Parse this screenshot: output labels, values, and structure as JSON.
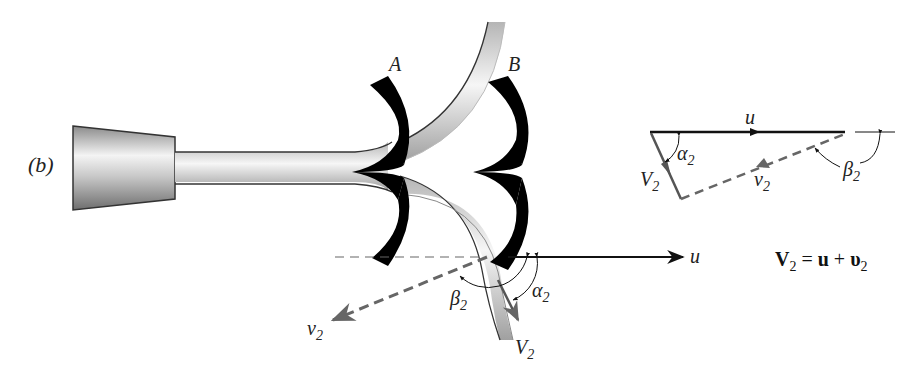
{
  "figure": {
    "panel_label": "(b)",
    "buckets": [
      {
        "label": "A"
      },
      {
        "label": "B"
      }
    ],
    "jet_diagram": {
      "u_label": "u",
      "v2_rel_label": "v",
      "v2_rel_sub": "2",
      "V2_abs_label": "V",
      "V2_abs_sub": "2",
      "alpha_label": "α",
      "alpha_sub": "2",
      "beta_label": "β",
      "beta_sub": "2"
    },
    "velocity_triangle": {
      "u_label": "u",
      "v2_rel_label": "v",
      "v2_rel_sub": "2",
      "V2_abs_label": "V",
      "V2_abs_sub": "2",
      "alpha_label": "α",
      "alpha_sub": "2",
      "beta_label": "β",
      "beta_sub": "2"
    },
    "equation": {
      "lhs": "V",
      "lhs_sub": "2",
      "eq": " = ",
      "t1": "u",
      "plus": " + ",
      "t2": "υ",
      "t2_sub": "2"
    },
    "colors": {
      "line": "#111111",
      "dashed": "#666666",
      "bucket": "#000000",
      "pipe_light": "#f2f2f2",
      "pipe_dark": "#a8a8a8"
    }
  }
}
